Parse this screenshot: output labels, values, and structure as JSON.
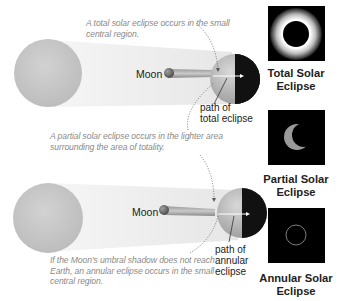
{
  "panels": [
    {
      "id": "total",
      "caption_lines": [
        "A total solar eclipse occurs in the small",
        "central region."
      ],
      "moon_label": "Moon",
      "path_label_lines": [
        "path of",
        "total eclipse"
      ],
      "photo_title_lines": [
        "Total Solar",
        "Eclipse"
      ]
    },
    {
      "id": "partial",
      "caption_lines": [
        "A partial solar eclipse occurs in the lighter area",
        "surrounding the area of totality."
      ],
      "photo_title_lines": [
        "Partial Solar",
        "Eclipse"
      ]
    },
    {
      "id": "annular",
      "caption_lines": [
        "If the Moon's umbral shadow does not reach",
        "Earth, an annular eclipse occurs in the small",
        "central region."
      ],
      "moon_label": "Moon",
      "path_label_lines": [
        "path of",
        "annular",
        "eclipse"
      ],
      "photo_title_lines": [
        "Annular Solar",
        "Eclipse"
      ]
    }
  ],
  "colors": {
    "sun": "#c8c8c8",
    "penumbra": "#efefef",
    "umbra": "#b5b5b5",
    "earth_day": "#b9b9b9",
    "earth_night": "#111111",
    "caption_text": "#8a8a8a",
    "photo_bg": "#000000"
  }
}
